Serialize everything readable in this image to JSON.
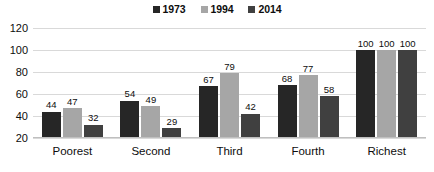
{
  "chart_data": {
    "type": "bar",
    "title": "",
    "subtitle": "",
    "xlabel": "",
    "ylabel": "",
    "categories": [
      "Poorest",
      "Second",
      "Third",
      "Fourth",
      "Richest"
    ],
    "series": [
      {
        "name": "1973",
        "color": "#262626",
        "values": [
          44,
          54,
          67,
          68,
          100
        ]
      },
      {
        "name": "1994",
        "color": "#a6a6a6",
        "values": [
          47,
          49,
          79,
          77,
          100
        ]
      },
      {
        "name": "2014",
        "color": "#404040",
        "values": [
          32,
          29,
          42,
          58,
          100
        ]
      }
    ],
    "ylim": [
      20,
      120
    ],
    "yticks": [
      20,
      40,
      60,
      80,
      100,
      120
    ],
    "ytick_labels": [
      "20",
      "40",
      "60",
      "80",
      "100",
      "120"
    ],
    "grid": true,
    "grid_axis": "y",
    "grid_color": "#d9d9d9",
    "legend_position": "top-center",
    "data_labels": true,
    "background": "#ffffff"
  },
  "legend": {
    "items": [
      {
        "label": "1973",
        "swatch": "legend-swatch-1973",
        "color": "#262626"
      },
      {
        "label": "1994",
        "swatch": "legend-swatch-1994",
        "color": "#a6a6a6"
      },
      {
        "label": "2014",
        "swatch": "legend-swatch-2014",
        "color": "#404040"
      }
    ]
  }
}
